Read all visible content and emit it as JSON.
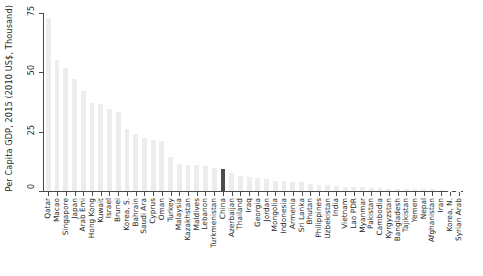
{
  "chart_data": {
    "type": "bar",
    "title": "",
    "subtitle": "",
    "xlabel": "",
    "ylabel": "Per Capita GDP, 2015 (2010 US$, Thousand)",
    "ylim": [
      0,
      75
    ],
    "yticks": [
      0,
      25,
      50,
      75
    ],
    "ytick_labels": [
      "0",
      "25",
      "50",
      "75"
    ],
    "grid": false,
    "legend": null,
    "bar_color": "#ededed",
    "highlight_color": "#4d4d4d",
    "highlight_category": "China",
    "axis_color": "#4a4a4a",
    "categories": [
      "Qatar",
      "Macao",
      "Singapore",
      "Japan",
      "Arab Emi",
      "Hong Kong",
      "Kuwait",
      "Israel",
      "Brunei",
      "Korea, S.",
      "Bahrain",
      "Saudi Ara",
      "Cyprus",
      "Oman",
      "Turkey",
      "Malaysia",
      "Kazakhstan",
      "Maldives",
      "Lebanon",
      "Turkmenistan",
      "China",
      "Azerbaijan",
      "Thailand",
      "Iraq",
      "Georgia",
      "Jordan",
      "Mongolia",
      "Indonesia",
      "Armenia",
      "Sri Lanka",
      "Bhutan",
      "Philippines",
      "Uzbekistan",
      "India",
      "Vietnam",
      "Lao PDR",
      "Myanmar",
      "Pakistan",
      "Cambodia",
      "Kyrgyzstan",
      "Bangladesh",
      "Tajikistan",
      "Yemen",
      "Nepal",
      "Afghanistan",
      "Iran",
      "Korea, N.",
      "Syrian Arab"
    ],
    "values": [
      73.0,
      55.0,
      52.0,
      47.0,
      42.0,
      37.0,
      36.5,
      34.5,
      33.5,
      26.0,
      24.0,
      22.5,
      21.5,
      21.0,
      14.5,
      11.5,
      11.0,
      10.8,
      10.4,
      9.8,
      9.2,
      7.8,
      6.3,
      5.9,
      5.5,
      5.0,
      4.3,
      4.1,
      4.0,
      3.7,
      3.0,
      2.7,
      2.4,
      2.0,
      1.9,
      1.7,
      1.5,
      1.3,
      1.1,
      1.0,
      0.95,
      0.9,
      0.85,
      0.75,
      0.65,
      0.25,
      0.1,
      0.05
    ]
  }
}
